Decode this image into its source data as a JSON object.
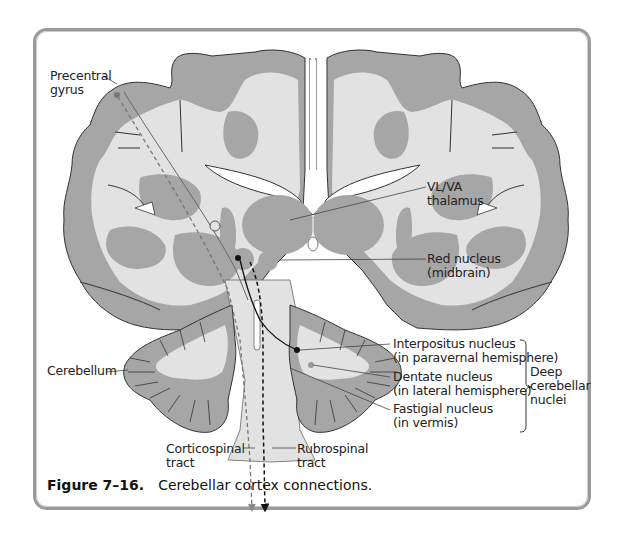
{
  "figure": {
    "number": "Figure 7–16.",
    "caption": "Cerebellar cortex connections."
  },
  "labels": {
    "precentral_gyrus": [
      "Precentral",
      "gyrus"
    ],
    "vl_va_thalamus": [
      "VL/VA",
      "thalamus"
    ],
    "red_nucleus": [
      "Red nucleus",
      "(midbrain)"
    ],
    "cerebellum": [
      "Cerebellum"
    ],
    "interpositus_nucleus": [
      "Interpositus nucleus",
      "(in paravernal hemisphere)"
    ],
    "dentate_nucleus": [
      "Dentate nucleus",
      "(in lateral hemisphere)"
    ],
    "fastigial_nucleus": [
      "Fastigial nucleus",
      "(in vermis)"
    ],
    "deep_cerebellar_nuclei": [
      "Deep",
      "cerebellar",
      "nuclei"
    ],
    "corticospinal_tract": [
      "Corticospinal",
      "tract"
    ],
    "rubrospinal_tract": [
      "Rubrospinal",
      "tract"
    ]
  },
  "colors": {
    "gray_matter": "#a6a6a6",
    "white_matter": "#e2e2e2",
    "outline": "#333333",
    "frame": "#9a9a9a"
  }
}
